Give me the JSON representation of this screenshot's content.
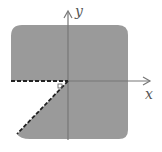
{
  "diagram": {
    "title": "",
    "axes": {
      "x_label": "x",
      "y_label": "y"
    },
    "colors": {
      "region_fill": "#9a9a9a",
      "axis": "#777777",
      "boundary": "#222222",
      "background": "#ffffff"
    },
    "region": {
      "shaded": "entire square minus third-quadrant wedge",
      "excluded_wedge": {
        "from_ray": "negative x-axis",
        "to_ray": "line from origin into third quadrant (approx. angle -135° to -130°)",
        "boundary_style": "dashed"
      }
    }
  }
}
